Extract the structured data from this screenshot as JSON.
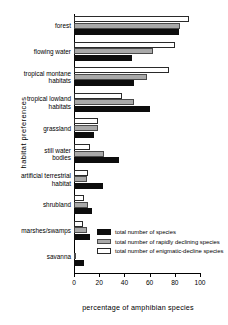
{
  "chart_data": {
    "type": "bar",
    "orientation": "horizontal",
    "title": "",
    "xlabel": "percentage of amphibian species",
    "ylabel": "habitat preferences",
    "xlim": [
      0,
      100
    ],
    "xticks": [
      0,
      20,
      40,
      60,
      80,
      100
    ],
    "grid": false,
    "legend_position": "inside-lower-right",
    "categories": [
      "forest",
      "flowing water",
      "tropical montane\nhabitats",
      "tropical lowland\nhabitats",
      "grassland",
      "still water\nbodies",
      "artificial terrestrial\nhabitat",
      "shrubland",
      "marshes/swamps",
      "savanna"
    ],
    "series": [
      {
        "name": "total number of species",
        "style": "black",
        "color": "#0d0d0d",
        "values": [
          83,
          46,
          48,
          60,
          16,
          36,
          23,
          14,
          13,
          8
        ]
      },
      {
        "name": "total number of rapidly declining species",
        "style": "gray",
        "color": "#a9a9a9",
        "values": [
          84,
          63,
          58,
          48,
          19,
          24,
          10,
          11,
          10,
          1
        ]
      },
      {
        "name": "total number of enigmatic-decline species",
        "style": "white",
        "color": "#ffffff",
        "values": [
          91,
          80,
          75,
          38,
          19,
          13,
          11,
          8,
          7,
          0
        ]
      }
    ]
  },
  "axes": {
    "y_title": "habitat preferences",
    "x_title": "percentage of amphibian species",
    "x_tick_labels": [
      "0",
      "20",
      "40",
      "60",
      "80",
      "100"
    ]
  },
  "legend": {
    "entries": [
      {
        "label": "total number of species",
        "style": "black"
      },
      {
        "label": "total number of rapidly declining species",
        "style": "gray"
      },
      {
        "label": "total number of enigmatic-decline species",
        "style": "white"
      }
    ]
  }
}
